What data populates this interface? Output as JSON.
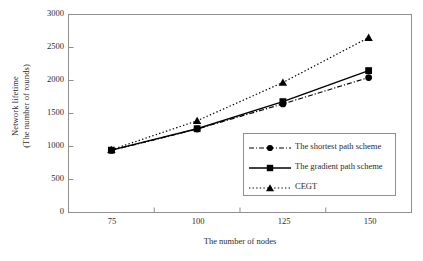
{
  "chart_data": {
    "type": "line",
    "title": "",
    "xlabel": "The number of nodes",
    "ylabel": "Network lifetime (The number of rounds)",
    "ylabel_line1": "Network lifetime",
    "ylabel_line2": "(The number of rounds)",
    "categories": [
      "75",
      "100",
      "125",
      "150"
    ],
    "x": [
      75,
      100,
      125,
      150
    ],
    "ylim": [
      0,
      3000
    ],
    "yticks": [
      "3000",
      "2500",
      "2000",
      "1500",
      "1000",
      "500",
      "0"
    ],
    "ytick_values": [
      3000,
      2500,
      2000,
      1500,
      1000,
      500,
      0
    ],
    "grid": false,
    "legend_position": "lower-right-inside",
    "series": [
      {
        "name": "The shortest path scheme",
        "marker": "circle",
        "linestyle": "dash-dot",
        "color": "#000000",
        "values": [
          940,
          1265,
          1645,
          2045
        ]
      },
      {
        "name": "The gradient path scheme",
        "marker": "square",
        "linestyle": "solid",
        "color": "#000000",
        "values": [
          945,
          1270,
          1680,
          2150
        ]
      },
      {
        "name": "CEGT",
        "marker": "triangle",
        "linestyle": "dotted",
        "color": "#000000",
        "values": [
          950,
          1390,
          1970,
          2650
        ]
      }
    ]
  },
  "legend": {
    "items": [
      {
        "label": "The shortest path scheme",
        "marker": "circle-marker",
        "linestyle": "dash-dot"
      },
      {
        "label": "The gradient path scheme",
        "marker": "square-marker",
        "linestyle": "solid"
      },
      {
        "label": "CEGT",
        "marker": "triangle-marker",
        "linestyle": "dotted"
      }
    ]
  },
  "axes": {
    "x_ticks": [
      "75",
      "100",
      "125",
      "150"
    ],
    "y_ticks": [
      "3000",
      "2500",
      "2000",
      "1500",
      "1000",
      "500",
      "0"
    ],
    "xlabel": "The number of nodes",
    "ylabel_line1": "Network lifetime",
    "ylabel_line2": "(The number of rounds)"
  },
  "colors": {
    "axis": "#8f8f8f",
    "line": "#000000",
    "text": "#2b2b2b",
    "background": "#ffffff"
  }
}
